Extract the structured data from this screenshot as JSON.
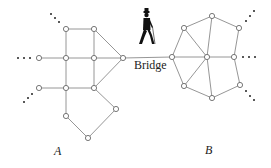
{
  "diagram": {
    "bridge_label": "Bridge",
    "component_a_label": "A",
    "component_b_label": "B",
    "icons": {
      "walker": "person-walking-icon"
    },
    "colors": {
      "edge": "#8a8a8a",
      "node_stroke": "#6a6a6a",
      "text": "#222222",
      "background": "#ffffff"
    },
    "graph_a": {
      "nodes": [
        [
          66,
          29
        ],
        [
          94,
          29
        ],
        [
          39,
          58
        ],
        [
          66,
          58
        ],
        [
          94,
          58
        ],
        [
          123,
          58
        ],
        [
          39,
          88
        ],
        [
          66,
          88
        ],
        [
          94,
          88
        ],
        [
          116,
          109
        ],
        [
          66,
          116
        ],
        [
          88,
          138
        ]
      ],
      "edges": [
        [
          0,
          1
        ],
        [
          0,
          3
        ],
        [
          1,
          4
        ],
        [
          1,
          5
        ],
        [
          2,
          3
        ],
        [
          3,
          4
        ],
        [
          4,
          5
        ],
        [
          3,
          7
        ],
        [
          4,
          8
        ],
        [
          5,
          8
        ],
        [
          6,
          7
        ],
        [
          7,
          8
        ],
        [
          7,
          10
        ],
        [
          8,
          9
        ],
        [
          9,
          11
        ],
        [
          10,
          11
        ]
      ]
    },
    "graph_b": {
      "nodes": [
        [
          172,
          57
        ],
        [
          184,
          28
        ],
        [
          212,
          16
        ],
        [
          239,
          28
        ],
        [
          207,
          57
        ],
        [
          234,
          57
        ],
        [
          184,
          86
        ],
        [
          212,
          98
        ],
        [
          240,
          85
        ]
      ],
      "edges": [
        [
          0,
          1
        ],
        [
          1,
          2
        ],
        [
          2,
          3
        ],
        [
          0,
          4
        ],
        [
          1,
          4
        ],
        [
          2,
          4
        ],
        [
          4,
          5
        ],
        [
          3,
          5
        ],
        [
          0,
          6
        ],
        [
          4,
          6
        ],
        [
          4,
          7
        ],
        [
          6,
          7
        ],
        [
          5,
          8
        ],
        [
          7,
          8
        ]
      ]
    },
    "bridge_edge": [
      [
        123,
        58
      ],
      [
        172,
        57
      ]
    ]
  }
}
